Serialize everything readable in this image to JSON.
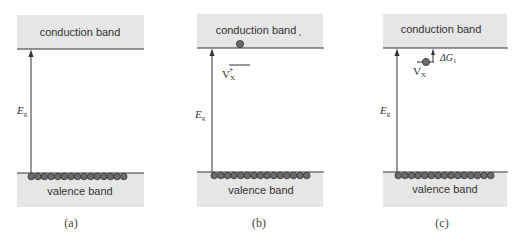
{
  "colors": {
    "band_fill": "#e6e6e6",
    "line": "#333333",
    "electron_fill": "#6b6b6b",
    "electron_stroke": "#2e2e2e"
  },
  "panels": [
    {
      "id": "a",
      "caption": "(a)",
      "conduction_label": "conduction band",
      "valence_label": "valence band",
      "gap_label": "E",
      "gap_subscript": "g",
      "valence_electron_count": 15
    },
    {
      "id": "b",
      "caption": "(b)",
      "conduction_label": "conduction band",
      "valence_label": "valence band",
      "gap_label": "E",
      "gap_subscript": "g",
      "valence_electron_count": 15,
      "defect_label": "V",
      "defect_subscript": "X",
      "defect_superscript": "+",
      "conduction_electron_count": 1
    },
    {
      "id": "c",
      "caption": "(c)",
      "conduction_label": "conduction band",
      "valence_label": "valence band",
      "gap_label": "E",
      "gap_subscript": "g",
      "valence_electron_count": 15,
      "defect_label": "V",
      "defect_subscript": "X",
      "trapped_electron_count": 1,
      "delta_label": "ΔG",
      "delta_subscript": "1"
    }
  ]
}
